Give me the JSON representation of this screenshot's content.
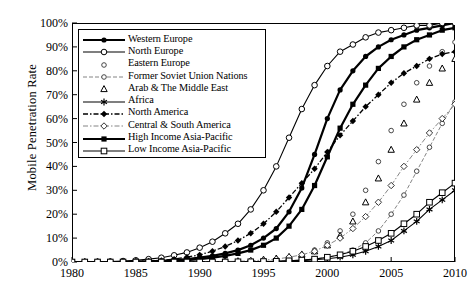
{
  "chart_data": {
    "type": "line",
    "title": "",
    "xlabel": "",
    "ylabel": "Mobile Penetration Rate",
    "xlim": [
      1980,
      2010
    ],
    "ylim": [
      0,
      100
    ],
    "xticks": [
      "1980",
      "1985",
      "1990",
      "1995",
      "2000",
      "2005",
      "2010"
    ],
    "yticks": [
      "0%",
      "10%",
      "20%",
      "30%",
      "40%",
      "50%",
      "60%",
      "70%",
      "80%",
      "90%",
      "100%"
    ],
    "grid": false,
    "legend_position": "upper-left-inside",
    "x": [
      1980,
      1981,
      1982,
      1983,
      1984,
      1985,
      1986,
      1987,
      1988,
      1989,
      1990,
      1991,
      1992,
      1993,
      1994,
      1995,
      1996,
      1997,
      1998,
      1999,
      2000,
      2001,
      2002,
      2003,
      2004,
      2005,
      2006,
      2007,
      2008,
      2009,
      2010
    ],
    "series": [
      {
        "name": "Western Europe",
        "marker": "filled-circle",
        "line": "solid-thick",
        "values": [
          0,
          0,
          0,
          0,
          0,
          0.2,
          0.3,
          0.5,
          0.8,
          1.2,
          1.8,
          2.6,
          3.6,
          5,
          7,
          10,
          14,
          21,
          31,
          45,
          60,
          72,
          80,
          86,
          90,
          93,
          95,
          97,
          98,
          99,
          100
        ]
      },
      {
        "name": "North Europe",
        "marker": "open-circle",
        "line": "solid-thin",
        "values": [
          0,
          0,
          0.1,
          0.2,
          0.4,
          0.7,
          1.2,
          1.8,
          2.8,
          4,
          6,
          8.5,
          12,
          16,
          22,
          30,
          40,
          52,
          64,
          74,
          82,
          88,
          91,
          94,
          96,
          97,
          98,
          99,
          99,
          100,
          100
        ]
      },
      {
        "name": "Eastern Europe",
        "marker": "open-circle-small",
        "line": "none",
        "values": [
          0,
          0,
          0,
          0,
          0,
          0,
          0,
          0,
          0,
          0,
          0,
          0.1,
          0.2,
          0.3,
          0.5,
          0.8,
          1.2,
          2,
          3,
          5,
          8,
          13,
          20,
          30,
          42,
          55,
          66,
          75,
          82,
          88,
          92
        ]
      },
      {
        "name": "Former Soviet Union Nations",
        "marker": "open-circle-small",
        "line": "dashed-light",
        "values": [
          0,
          0,
          0,
          0,
          0,
          0,
          0,
          0,
          0,
          0,
          0,
          0,
          0,
          0.1,
          0.1,
          0.2,
          0.3,
          0.5,
          0.8,
          1.2,
          2,
          3,
          5,
          8,
          13,
          20,
          28,
          38,
          48,
          58,
          67
        ]
      },
      {
        "name": "Arab & The Middle East",
        "marker": "open-triangle",
        "line": "none",
        "values": [
          0,
          0,
          0,
          0,
          0,
          0,
          0,
          0,
          0,
          0,
          0.1,
          0.2,
          0.3,
          0.4,
          0.6,
          1,
          1.5,
          2.2,
          3.2,
          4.5,
          7,
          11,
          17,
          25,
          35,
          47,
          58,
          68,
          75,
          81,
          85
        ]
      },
      {
        "name": "Africa",
        "marker": "asterisk",
        "line": "solid-thin",
        "values": [
          0,
          0,
          0,
          0,
          0,
          0,
          0,
          0,
          0,
          0,
          0,
          0,
          0,
          0.1,
          0.1,
          0.2,
          0.3,
          0.4,
          0.6,
          0.9,
          1.4,
          2,
          3,
          4.5,
          6.5,
          9,
          13,
          17,
          22,
          26,
          30
        ]
      },
      {
        "name": "North America",
        "marker": "filled-diamond",
        "line": "dash-dot",
        "values": [
          0,
          0,
          0,
          0,
          0.1,
          0.2,
          0.4,
          0.7,
          1.2,
          2,
          3,
          4.5,
          6.5,
          9,
          12,
          16,
          21,
          27,
          33,
          39,
          46,
          53,
          59,
          65,
          70,
          75,
          79,
          82,
          85,
          87,
          88
        ]
      },
      {
        "name": "Central & South America",
        "marker": "open-diamond",
        "line": "dash-dot-light",
        "values": [
          0,
          0,
          0,
          0,
          0,
          0,
          0,
          0,
          0,
          0,
          0.1,
          0.1,
          0.2,
          0.3,
          0.5,
          0.8,
          1.2,
          2,
          3,
          4.5,
          7,
          10,
          14,
          19,
          25,
          32,
          40,
          47,
          54,
          60,
          66
        ]
      },
      {
        "name": "High Income Asia-Pacific",
        "marker": "filled-square",
        "line": "solid-thick",
        "values": [
          0,
          0,
          0,
          0,
          0,
          0.1,
          0.2,
          0.3,
          0.5,
          0.8,
          1.2,
          1.8,
          2.6,
          3.6,
          5,
          7,
          10,
          15,
          22,
          32,
          44,
          56,
          66,
          74,
          81,
          86,
          90,
          93,
          95,
          97,
          98
        ]
      },
      {
        "name": "Low Income Asia-Pacific",
        "marker": "open-square",
        "line": "solid-thin",
        "values": [
          0,
          0,
          0,
          0,
          0,
          0,
          0,
          0,
          0,
          0,
          0,
          0,
          0,
          0.1,
          0.1,
          0.2,
          0.3,
          0.5,
          0.8,
          1.2,
          2,
          3,
          4.5,
          6.5,
          9,
          12,
          16,
          20,
          25,
          29,
          33
        ]
      }
    ]
  }
}
